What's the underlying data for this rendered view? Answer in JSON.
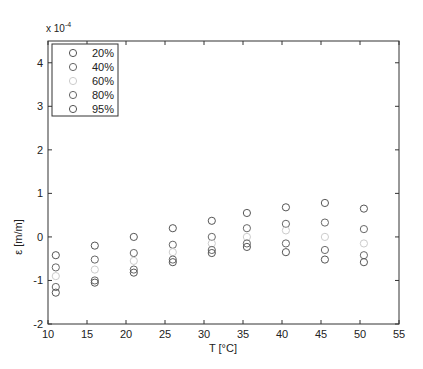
{
  "chart_data": {
    "type": "scatter",
    "title": "",
    "xlabel": "T [°C]",
    "ylabel": "ε [m/m]",
    "y_multiplier": "x 10^-4",
    "xlim": [
      10,
      55
    ],
    "ylim": [
      -2,
      4.5
    ],
    "xticks": [
      10,
      15,
      20,
      25,
      30,
      35,
      40,
      45,
      50,
      55
    ],
    "yticks": [
      -2,
      -1,
      0,
      1,
      2,
      3,
      4
    ],
    "grid": false,
    "legend_position": "upper-left",
    "x": [
      11,
      16,
      21,
      26,
      31,
      35.5,
      40.5,
      45.5,
      50.5
    ],
    "series": [
      {
        "name": "20%",
        "color": "#555555",
        "values": [
          -0.42,
          -0.2,
          0.0,
          0.2,
          0.37,
          0.55,
          0.68,
          0.78,
          0.65
        ]
      },
      {
        "name": "40%",
        "color": "#666666",
        "values": [
          -0.7,
          -0.52,
          -0.37,
          -0.18,
          0.0,
          0.2,
          0.3,
          0.33,
          0.18
        ]
      },
      {
        "name": "60%",
        "color": "#cccccc",
        "values": [
          -0.9,
          -0.75,
          -0.55,
          -0.35,
          -0.15,
          0.0,
          0.15,
          0.0,
          -0.15
        ]
      },
      {
        "name": "80%",
        "color": "#666666",
        "values": [
          -1.15,
          -1.0,
          -0.75,
          -0.52,
          -0.3,
          -0.15,
          -0.15,
          -0.3,
          -0.42
        ]
      },
      {
        "name": "95%",
        "color": "#555555",
        "values": [
          -1.28,
          -1.05,
          -0.82,
          -0.58,
          -0.37,
          -0.23,
          -0.35,
          -0.52,
          -0.58
        ]
      }
    ]
  }
}
